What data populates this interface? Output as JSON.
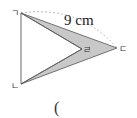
{
  "diagram": {
    "vertices": {
      "a": {
        "label": "ㄱ",
        "x": 21,
        "y": 13
      },
      "b": {
        "label": "ㄴ",
        "x": 21,
        "y": 84
      },
      "c": {
        "label": "ㄷ",
        "x": 117,
        "y": 48
      },
      "d": {
        "label": "ㄹ",
        "x": 82,
        "y": 49
      }
    },
    "measurement": "9 cm",
    "answer_prefix": "(",
    "colors": {
      "fill": "#c8c8c8",
      "stroke": "#555555",
      "dashed": "#aaaaaa"
    }
  }
}
